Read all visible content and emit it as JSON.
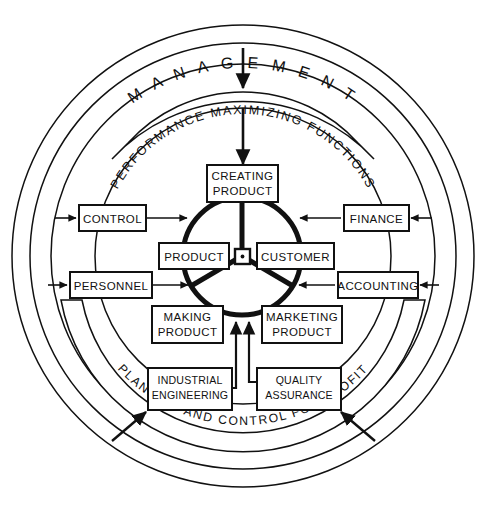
{
  "diagram": {
    "rings": {
      "outer_label": "M A N A G E M E N T",
      "banner_top_label": "PERFORMANCE MAXIMIZING FUNCTIONS",
      "banner_bottom_label": "PLANNING AND CONTROL FOR PROFIT"
    },
    "hub": {
      "name": "center-hub",
      "marker": "dot"
    },
    "core_boxes": [
      {
        "id": "creating-product",
        "lines": [
          "CREATING",
          "PRODUCT"
        ]
      },
      {
        "id": "product",
        "lines": [
          "PRODUCT"
        ]
      },
      {
        "id": "customer",
        "lines": [
          "CUSTOMER"
        ]
      },
      {
        "id": "making-product",
        "lines": [
          "MAKING",
          "PRODUCT"
        ]
      },
      {
        "id": "marketing-product",
        "lines": [
          "MARKETING",
          "PRODUCT"
        ]
      }
    ],
    "support_boxes": [
      {
        "id": "control",
        "lines": [
          "CONTROL"
        ],
        "side": "left"
      },
      {
        "id": "personnel",
        "lines": [
          "PERSONNEL"
        ],
        "side": "left"
      },
      {
        "id": "finance",
        "lines": [
          "FINANCE"
        ],
        "side": "right"
      },
      {
        "id": "accounting",
        "lines": [
          "ACCOUNTING"
        ],
        "side": "right"
      },
      {
        "id": "industrial-engineering",
        "lines": [
          "INDUSTRIAL",
          "ENGINEERING"
        ],
        "side": "bottom"
      },
      {
        "id": "quality-assurance",
        "lines": [
          "QUALITY",
          "ASSURANCE"
        ],
        "side": "bottom"
      }
    ],
    "colors": {
      "ink": "#111111",
      "paper": "#ffffff"
    }
  }
}
